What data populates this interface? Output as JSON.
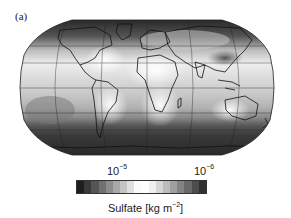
{
  "figure": {
    "panel_label": "(a)",
    "map": {
      "projection": "Robinson",
      "variable": "Sulfate column burden",
      "shading": "grayscale"
    },
    "colorbar": {
      "ticks": [
        {
          "base": "10",
          "exp": "−5"
        },
        {
          "base": "10",
          "exp": "−6"
        }
      ],
      "title_prefix": "Sulfate [kg m",
      "title_exp": "−2",
      "title_suffix": "]",
      "colors": [
        "#1e1e1e",
        "#3a3a3a",
        "#555555",
        "#707070",
        "#8c8c8c",
        "#a8a8a8",
        "#c4c4c4",
        "#e0e0e0",
        "#fafafa",
        "#ffffff",
        "#f0f0f0",
        "#d6d6d6",
        "#bcbcbc",
        "#a0a0a0",
        "#848484",
        "#686868",
        "#4c4c4c",
        "#303030"
      ]
    }
  }
}
